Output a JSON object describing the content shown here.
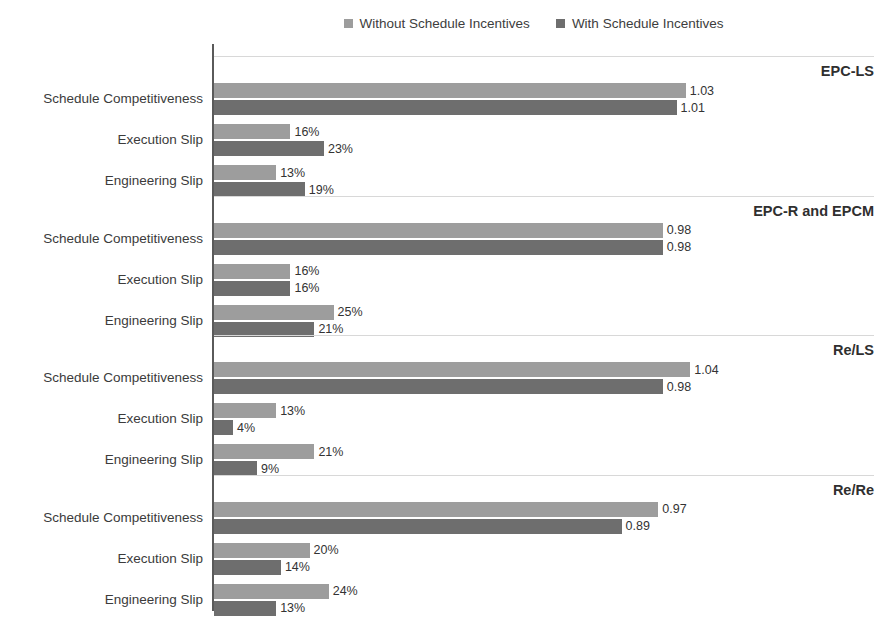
{
  "legend": {
    "entries": [
      {
        "label": "Without Schedule Incentives",
        "color": "#9d9d9d",
        "series": "without"
      },
      {
        "label": "With Schedule Incentives",
        "color": "#6e6e6e",
        "series": "with"
      }
    ]
  },
  "chart_data": {
    "type": "bar",
    "orientation": "horizontal",
    "title": "",
    "xlabel": "",
    "ylabel": "",
    "grid": false,
    "legend_position": "top",
    "legend_entries": [
      "Without Schedule Incentives",
      "With Schedule Incentives"
    ],
    "categories": [
      "Schedule Competitiveness",
      "Execution Slip",
      "Engineering Slip"
    ],
    "groups": [
      {
        "name": "EPC-LS",
        "rows": [
          {
            "category": "Schedule Competitiveness",
            "without": 1.03,
            "with": 1.01,
            "without_label": "1.03",
            "with_label": "1.01",
            "unit": "ratio"
          },
          {
            "category": "Execution Slip",
            "without": 16,
            "with": 23,
            "without_label": "16%",
            "with_label": "23%",
            "unit": "percent"
          },
          {
            "category": "Engineering Slip",
            "without": 13,
            "with": 19,
            "without_label": "13%",
            "with_label": "19%",
            "unit": "percent"
          }
        ]
      },
      {
        "name": "EPC-R and EPCM",
        "rows": [
          {
            "category": "Schedule Competitiveness",
            "without": 0.98,
            "with": 0.98,
            "without_label": "0.98",
            "with_label": "0.98",
            "unit": "ratio"
          },
          {
            "category": "Execution Slip",
            "without": 16,
            "with": 16,
            "without_label": "16%",
            "with_label": "16%",
            "unit": "percent"
          },
          {
            "category": "Engineering Slip",
            "without": 25,
            "with": 21,
            "without_label": "25%",
            "with_label": "21%",
            "unit": "percent"
          }
        ]
      },
      {
        "name": "Re/LS",
        "rows": [
          {
            "category": "Schedule Competitiveness",
            "without": 1.04,
            "with": 0.98,
            "without_label": "1.04",
            "with_label": "0.98",
            "unit": "ratio"
          },
          {
            "category": "Execution Slip",
            "without": 13,
            "with": 4,
            "without_label": "13%",
            "with_label": "4%",
            "unit": "percent"
          },
          {
            "category": "Engineering Slip",
            "without": 21,
            "with": 9,
            "without_label": "21%",
            "with_label": "9%",
            "unit": "percent"
          }
        ]
      },
      {
        "name": "Re/Re",
        "rows": [
          {
            "category": "Schedule Competitiveness",
            "without": 0.97,
            "with": 0.89,
            "without_label": "0.97",
            "with_label": "0.89",
            "unit": "ratio"
          },
          {
            "category": "Execution Slip",
            "without": 20,
            "with": 14,
            "without_label": "20%",
            "with_label": "14%",
            "unit": "percent"
          },
          {
            "category": "Engineering Slip",
            "without": 24,
            "with": 13,
            "without_label": "24%",
            "with_label": "13%",
            "unit": "percent"
          }
        ]
      }
    ],
    "colors": {
      "without": "#9d9d9d",
      "with": "#6e6e6e",
      "axis": "#5a5a5a",
      "separator": "#d8d8d8"
    }
  }
}
